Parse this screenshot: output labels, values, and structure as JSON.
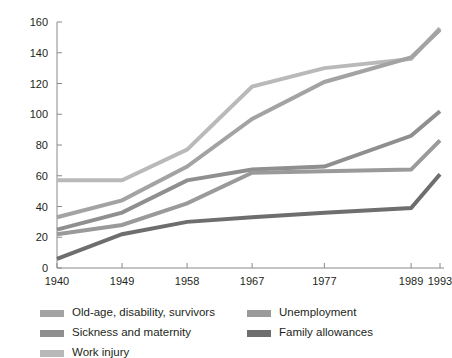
{
  "chart_data": {
    "type": "line",
    "title": "",
    "xlabel": "",
    "ylabel": "",
    "x": [
      1940,
      1949,
      1958,
      1967,
      1977,
      1989,
      1993
    ],
    "xtick_labels": [
      "1940",
      "1949",
      "1958",
      "1967",
      "1977",
      "1989",
      "1993"
    ],
    "ytick_labels": [
      "0",
      "20",
      "40",
      "60",
      "80",
      "100",
      "120",
      "140",
      "160"
    ],
    "yticks": [
      0,
      20,
      40,
      60,
      80,
      100,
      120,
      140,
      160
    ],
    "ylim": [
      0,
      160
    ],
    "grid": false,
    "legend_position": "bottom",
    "series": [
      {
        "name": "Old-age, disability, survivors",
        "color": "#a3a3a3",
        "values": [
          33,
          44,
          66,
          97,
          121,
          137,
          155
        ]
      },
      {
        "name": "Sickness and maternity",
        "color": "#8f8f8f",
        "values": [
          25,
          36,
          57,
          64,
          66,
          86,
          102
        ]
      },
      {
        "name": "Work injury",
        "color": "#b9b9b9",
        "values": [
          57,
          57,
          77,
          118,
          130,
          136,
          156
        ]
      },
      {
        "name": "Unemployment",
        "color": "#9a9a9a",
        "values": [
          22,
          28,
          42,
          62,
          63,
          64,
          83
        ]
      },
      {
        "name": "Family allowances",
        "color": "#6e6e6e",
        "values": [
          6,
          22,
          30,
          33,
          36,
          39,
          61
        ]
      }
    ]
  },
  "legend": {
    "columns": [
      {
        "items": [
          {
            "label": "Old-age, disability, survivors",
            "color": "#a3a3a3"
          },
          {
            "label": "Sickness and maternity",
            "color": "#8f8f8f"
          },
          {
            "label": "Work injury",
            "color": "#b9b9b9"
          }
        ]
      },
      {
        "items": [
          {
            "label": "Unemployment",
            "color": "#9a9a9a"
          },
          {
            "label": "Family allowances",
            "color": "#6e6e6e"
          }
        ]
      }
    ]
  },
  "axis": {
    "color": "#8a8a8a"
  }
}
